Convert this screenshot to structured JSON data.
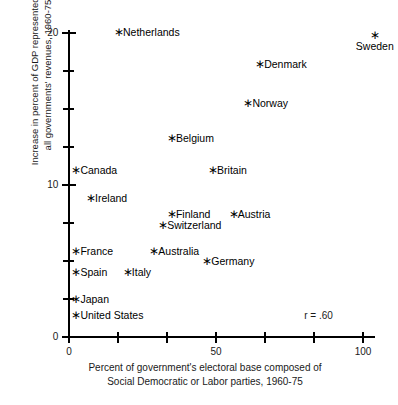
{
  "chart_data": {
    "type": "scatter",
    "title": "",
    "xlabel_lines": [
      "Percent of government's electoral base composed of",
      "Social Democratic or Labor parties, 1960-75"
    ],
    "ylabel_lines": [
      "Increase in percent of GDP represented by",
      "all governments' revenues, 1960-75"
    ],
    "xlim": [
      0,
      100
    ],
    "ylim": [
      0,
      20.2
    ],
    "x_ticks": [
      0,
      50,
      100
    ],
    "x_tick_labels": [
      "0",
      "50",
      "100"
    ],
    "x_minor_ticks": [
      16.7,
      33.3,
      66.7,
      83.3
    ],
    "y_ticks": [
      0,
      10,
      20
    ],
    "y_tick_labels": [
      "0",
      "10",
      "20"
    ],
    "y_minor_ticks": [
      2.5,
      5,
      7.5,
      12.5,
      15,
      17.5
    ],
    "grid": false,
    "legend": "none",
    "annotations": [
      {
        "text": "r  =  .60",
        "x": 80,
        "y": 1.45
      }
    ],
    "points": [
      {
        "label": "Netherlands",
        "x": 16,
        "y": 20.2,
        "label_pos": "right"
      },
      {
        "label": "Sweden",
        "x": 103,
        "y": 20.0,
        "label_pos": "below"
      },
      {
        "label": "Denmark",
        "x": 64,
        "y": 18.1,
        "label_pos": "right"
      },
      {
        "label": "Norway",
        "x": 60,
        "y": 15.5,
        "label_pos": "right"
      },
      {
        "label": "Belgium",
        "x": 34,
        "y": 13.2,
        "label_pos": "right"
      },
      {
        "label": "Britain",
        "x": 48,
        "y": 11.1,
        "label_pos": "right"
      },
      {
        "label": "Canada",
        "x": 1.5,
        "y": 11.1,
        "label_pos": "right"
      },
      {
        "label": "Ireland",
        "x": 6.5,
        "y": 9.3,
        "label_pos": "right"
      },
      {
        "label": "Finland",
        "x": 34,
        "y": 8.2,
        "label_pos": "right"
      },
      {
        "label": "Austria",
        "x": 55,
        "y": 8.2,
        "label_pos": "right"
      },
      {
        "label": "Switzerland",
        "x": 31,
        "y": 7.5,
        "label_pos": "right"
      },
      {
        "label": "France",
        "x": 1.5,
        "y": 5.8,
        "label_pos": "right"
      },
      {
        "label": "Australia",
        "x": 28,
        "y": 5.8,
        "label_pos": "right"
      },
      {
        "label": "Germany",
        "x": 46,
        "y": 5.1,
        "label_pos": "right"
      },
      {
        "label": "Spain",
        "x": 1.5,
        "y": 4.4,
        "label_pos": "right"
      },
      {
        "label": "Italy",
        "x": 19,
        "y": 4.4,
        "label_pos": "right"
      },
      {
        "label": "Japan",
        "x": 1.5,
        "y": 2.6,
        "label_pos": "right"
      },
      {
        "label": "United States",
        "x": 1.5,
        "y": 1.55,
        "label_pos": "right"
      }
    ]
  }
}
